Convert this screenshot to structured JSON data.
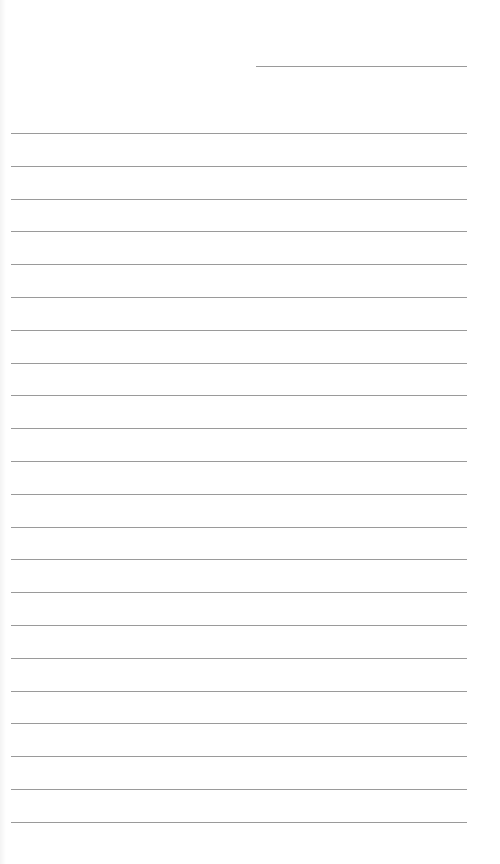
{
  "page": {
    "type": "lined-paper",
    "background_color": "#ffffff",
    "line_color": "#9a9a9a"
  },
  "header": {
    "date_line": {
      "x": 256,
      "y": 66,
      "width": 211,
      "text": ""
    }
  },
  "ruled_lines": {
    "x": 11,
    "width": 456,
    "first_y": 133,
    "spacing": 32.8,
    "count": 22,
    "entries": [
      "",
      "",
      "",
      "",
      "",
      "",
      "",
      "",
      "",
      "",
      "",
      "",
      "",
      "",
      "",
      "",
      "",
      "",
      "",
      "",
      "",
      ""
    ]
  }
}
